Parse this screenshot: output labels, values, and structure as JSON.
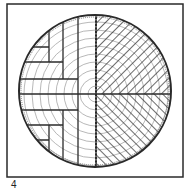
{
  "figure": {
    "label": "4",
    "colors": {
      "ink": "#2a2a2a",
      "rings": "#9a9a9a",
      "background": "#ffffff"
    }
  }
}
